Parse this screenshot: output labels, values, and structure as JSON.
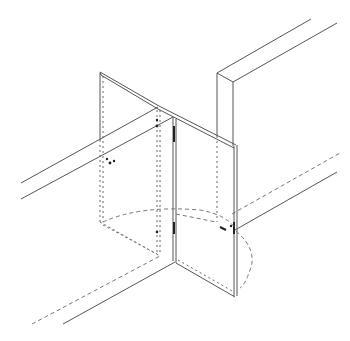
{
  "diagram": {
    "title": "Bi-fold door pivot installation (isometric line drawing)",
    "stroke_color": "#555555",
    "background": "#ffffff",
    "parts": [
      {
        "id": "left-door-panel",
        "label": "Left door panel"
      },
      {
        "id": "right-door-panel",
        "label": "Right door panel"
      },
      {
        "id": "hinge-post",
        "label": "Hinge edge"
      },
      {
        "id": "wall-jamb",
        "label": "Wall jamb"
      },
      {
        "id": "top-track",
        "label": "Track rails"
      },
      {
        "id": "floor-guide",
        "label": "Floor guide lines"
      },
      {
        "id": "swing-arc",
        "label": "Door swing arc"
      }
    ]
  }
}
